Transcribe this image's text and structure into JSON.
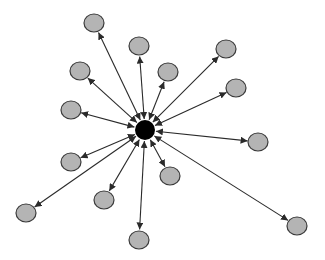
{
  "diagram": {
    "type": "star-network",
    "colors": {
      "hub_fill": "#000000",
      "node_fill": "#b4b4b4",
      "node_stroke": "#3a3a3a",
      "edge": "#2a2a2a",
      "background": "#ffffff"
    },
    "hub": {
      "id": "hub",
      "x": 145,
      "y": 130,
      "r": 10
    },
    "nodes": [
      {
        "id": "n1",
        "x": 94,
        "y": 23,
        "rx": 10,
        "ry": 9
      },
      {
        "id": "n2",
        "x": 139,
        "y": 46,
        "rx": 10,
        "ry": 9
      },
      {
        "id": "n3",
        "x": 168,
        "y": 72,
        "rx": 10,
        "ry": 9
      },
      {
        "id": "n4",
        "x": 226,
        "y": 49,
        "rx": 10,
        "ry": 9
      },
      {
        "id": "n5",
        "x": 80,
        "y": 71,
        "rx": 10,
        "ry": 9
      },
      {
        "id": "n6",
        "x": 71,
        "y": 110,
        "rx": 10,
        "ry": 9
      },
      {
        "id": "n7",
        "x": 236,
        "y": 88,
        "rx": 10,
        "ry": 9
      },
      {
        "id": "n8",
        "x": 258,
        "y": 142,
        "rx": 10,
        "ry": 9
      },
      {
        "id": "n9",
        "x": 71,
        "y": 162,
        "rx": 10,
        "ry": 9
      },
      {
        "id": "n10",
        "x": 170,
        "y": 176,
        "rx": 10,
        "ry": 9
      },
      {
        "id": "n11",
        "x": 104,
        "y": 200,
        "rx": 10,
        "ry": 9
      },
      {
        "id": "n12",
        "x": 26,
        "y": 213,
        "rx": 10,
        "ry": 9
      },
      {
        "id": "n13",
        "x": 139,
        "y": 240,
        "rx": 10,
        "ry": 9
      },
      {
        "id": "n14",
        "x": 297,
        "y": 226,
        "rx": 10,
        "ry": 9
      }
    ],
    "edges": [
      {
        "from": "hub",
        "to": "n1",
        "bidirectional": true
      },
      {
        "from": "hub",
        "to": "n2",
        "bidirectional": true
      },
      {
        "from": "hub",
        "to": "n3",
        "bidirectional": true
      },
      {
        "from": "hub",
        "to": "n4",
        "bidirectional": true
      },
      {
        "from": "hub",
        "to": "n5",
        "bidirectional": true
      },
      {
        "from": "hub",
        "to": "n6",
        "bidirectional": true
      },
      {
        "from": "hub",
        "to": "n7",
        "bidirectional": true
      },
      {
        "from": "hub",
        "to": "n8",
        "bidirectional": true
      },
      {
        "from": "hub",
        "to": "n9",
        "bidirectional": true
      },
      {
        "from": "hub",
        "to": "n10",
        "bidirectional": true
      },
      {
        "from": "hub",
        "to": "n11",
        "bidirectional": true
      },
      {
        "from": "hub",
        "to": "n12",
        "bidirectional": true
      },
      {
        "from": "hub",
        "to": "n13",
        "bidirectional": true
      },
      {
        "from": "hub",
        "to": "n14",
        "bidirectional": true
      }
    ]
  }
}
